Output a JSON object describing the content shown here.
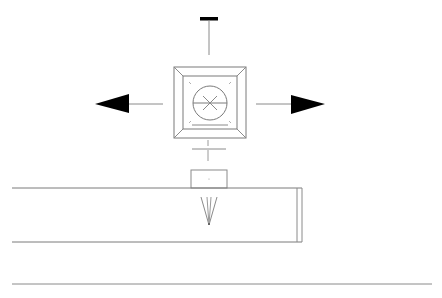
{
  "diagram": {
    "type": "technical-drawing",
    "colors": {
      "background": "#ffffff",
      "line": "#8a8a8a",
      "line_dark": "#6e6e6e",
      "fill_black": "#000000"
    },
    "elements": {
      "top_arrow": {
        "direction": "up",
        "style": "t-bar"
      },
      "left_arrow": {
        "direction": "left",
        "style": "filled-triangle"
      },
      "right_arrow": {
        "direction": "right",
        "style": "filled-triangle"
      },
      "bottom_marker": {
        "direction": "down",
        "style": "t-bar-outline"
      },
      "diffuser": {
        "shape": "square",
        "layers": 2,
        "center_symbol": "circle-with-x"
      },
      "duct": {
        "shape": "rectangle",
        "open_left": true
      },
      "neck": {
        "shape": "small-rectangle"
      },
      "flow_indicator": {
        "shape": "v-funnel"
      },
      "floor_line": {
        "shape": "horizontal-line"
      }
    }
  }
}
